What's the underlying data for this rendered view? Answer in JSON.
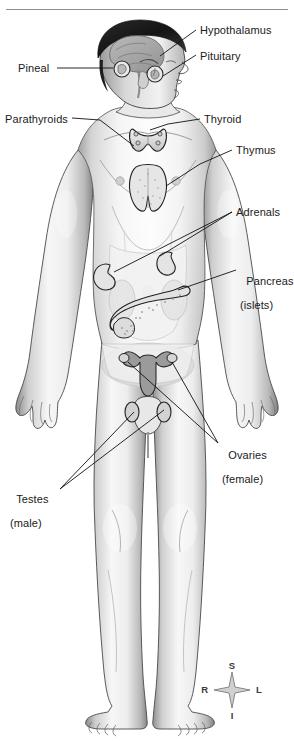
{
  "figure": {
    "style": "grayscale anatomical illustration",
    "background_color": "#ffffff",
    "ink_color": "#1a1a1a",
    "divider_color": "#8d8d8d"
  },
  "labels": [
    {
      "id": "hypothalamus",
      "text": "Hypothalamus",
      "sub": "",
      "align": "left",
      "x": 200,
      "y": 24
    },
    {
      "id": "pituitary",
      "text": "Pituitary",
      "sub": "",
      "align": "left",
      "x": 200,
      "y": 50
    },
    {
      "id": "pineal",
      "text": "Pineal",
      "sub": "",
      "align": "right",
      "x": 18,
      "y": 62
    },
    {
      "id": "parathyroids",
      "text": "Parathyroids",
      "sub": "",
      "align": "right",
      "x": 5,
      "y": 113
    },
    {
      "id": "thyroid",
      "text": "Thyroid",
      "sub": "",
      "align": "left",
      "x": 204,
      "y": 113
    },
    {
      "id": "thymus",
      "text": "Thymus",
      "sub": "",
      "align": "left",
      "x": 236,
      "y": 144
    },
    {
      "id": "adrenals",
      "text": "Adrenals",
      "sub": "",
      "align": "left",
      "x": 236,
      "y": 206
    },
    {
      "id": "pancreas",
      "text": "Pancreas",
      "sub": "(islets)",
      "align": "left",
      "x": 240,
      "y": 263
    },
    {
      "id": "ovaries",
      "text": "Ovaries",
      "sub": "(female)",
      "align": "left",
      "x": 222,
      "y": 437
    },
    {
      "id": "testes",
      "text": "Testes",
      "sub": "(male)",
      "align": "right",
      "x": 10,
      "y": 481
    }
  ],
  "compass": {
    "name": "orientation-compass",
    "center_x": 232,
    "center_y": 690,
    "superior": "S",
    "inferior": "I",
    "right": "R",
    "left": "L"
  }
}
